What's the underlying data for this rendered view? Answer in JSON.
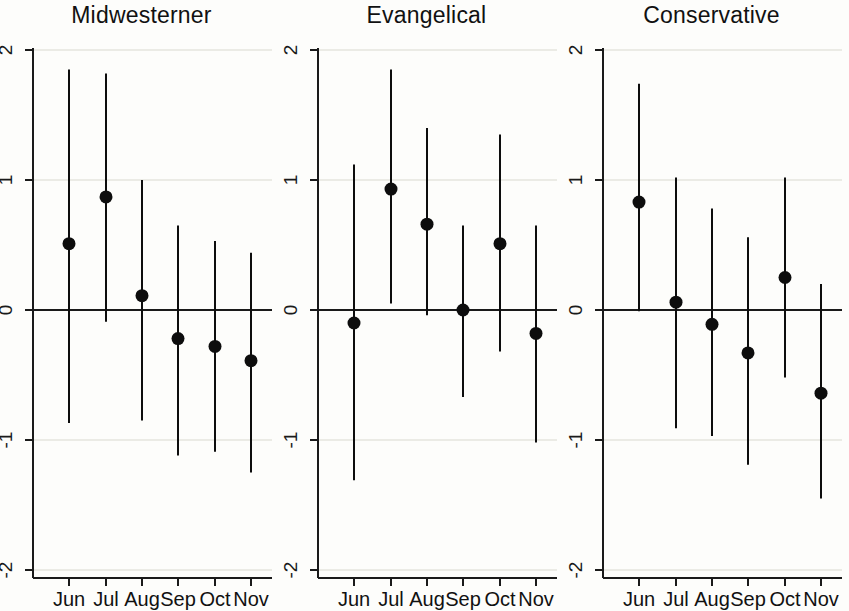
{
  "figure": {
    "background": "#fdfdfb",
    "axis_color": "#1a1a1a",
    "grid_color": "#d9d9cf",
    "marker_color": "#0d0d0d",
    "zero_line_color": "#1a1a1a"
  },
  "chart_data": {
    "type": "scatter",
    "title": "",
    "xlabel": "",
    "ylabel": "",
    "ylim": [
      -2,
      2
    ],
    "yticks": [
      2,
      1,
      0,
      -1,
      -2
    ],
    "ytick_labels": [
      "2",
      "1",
      "0",
      "-1",
      "-2"
    ],
    "categories": [
      "Jun",
      "Jul",
      "Aug",
      "Sep",
      "Oct",
      "Nov"
    ],
    "grid": "horizontal",
    "legend": "none",
    "error_bars": "vertical confidence intervals",
    "zero_reference_line": 0,
    "panels": [
      {
        "title": "Midwesterner",
        "values": [
          0.51,
          0.87,
          0.11,
          -0.22,
          -0.28,
          -0.39
        ],
        "ci_low": [
          -0.87,
          -0.09,
          -0.85,
          -1.12,
          -1.09,
          -1.25
        ],
        "ci_high": [
          1.85,
          1.82,
          1.0,
          0.65,
          0.53,
          0.44
        ]
      },
      {
        "title": "Evangelical",
        "values": [
          -0.1,
          0.93,
          0.66,
          0.0,
          0.51,
          -0.18
        ],
        "ci_low": [
          -1.31,
          0.05,
          -0.04,
          -0.67,
          -0.32,
          -1.02
        ],
        "ci_high": [
          1.12,
          1.85,
          1.4,
          0.65,
          1.35,
          0.65
        ]
      },
      {
        "title": "Conservative",
        "values": [
          0.83,
          0.06,
          -0.11,
          -0.33,
          0.25,
          -0.64
        ],
        "ci_low": [
          -0.01,
          -0.91,
          -0.97,
          -1.19,
          -0.52,
          -1.45
        ],
        "ci_high": [
          1.74,
          1.02,
          0.78,
          0.56,
          1.02,
          0.2
        ]
      }
    ]
  }
}
